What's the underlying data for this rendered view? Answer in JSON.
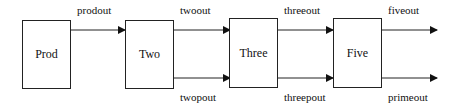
{
  "diagram": {
    "nodes": [
      {
        "id": "prod",
        "label": "Prod"
      },
      {
        "id": "two",
        "label": "Two"
      },
      {
        "id": "three",
        "label": "Three"
      },
      {
        "id": "five",
        "label": "Five"
      }
    ],
    "edges": [
      {
        "from": "prod",
        "to": "two",
        "label": "prodout"
      },
      {
        "from": "two",
        "to": "three",
        "label": "twoout"
      },
      {
        "from": "two",
        "to": "three",
        "label": "twopout"
      },
      {
        "from": "three",
        "to": "five",
        "label": "threeout"
      },
      {
        "from": "three",
        "to": "five",
        "label": "threepout"
      },
      {
        "from": "five",
        "to": null,
        "label": "fiveout"
      },
      {
        "from": "five",
        "to": null,
        "label": "primeout"
      }
    ]
  }
}
